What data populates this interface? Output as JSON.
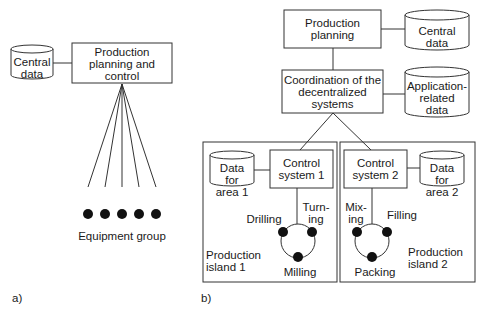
{
  "diagram_a": {
    "label": "a)",
    "central_data": "Central\ndata",
    "ppc_box": "Production\nplanning and\ncontrol",
    "equipment_label": "Equipment group",
    "equipment_count": 5
  },
  "diagram_b": {
    "label": "b)",
    "production_planning": "Production\nplanning",
    "central_data": "Central\ndata",
    "coordination": "Coordination of the\ndecentralized\nsystems",
    "application_data": "Application-\nrelated\ndata",
    "island1": {
      "data": "Data\nfor\narea 1",
      "control": "Control\nsystem 1",
      "drilling": "Drilling",
      "turning": "Turn-\ning",
      "milling": "Milling",
      "name": "Production\nisland 1"
    },
    "island2": {
      "data": "Data\nfor\narea 2",
      "control": "Control\nsystem 2",
      "mixing": "Mix-\ning",
      "filling": "Filling",
      "packing": "Packing",
      "name": "Production\nisland 2"
    }
  }
}
